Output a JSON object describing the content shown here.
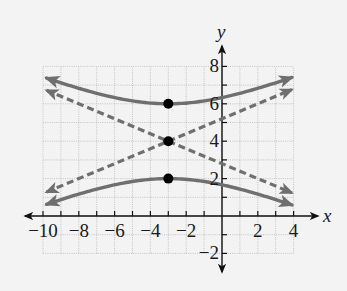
{
  "chart_data": {
    "type": "line",
    "title": "",
    "xlabel": "x",
    "ylabel": "y",
    "xlim": [
      -10,
      4
    ],
    "ylim": [
      -2,
      8
    ],
    "grid": true,
    "x_tick_labels": [
      "-10",
      "-8",
      "-6",
      "-4",
      "-2",
      "2",
      "4"
    ],
    "x_tick_values": [
      -10,
      -8,
      -6,
      -4,
      -2,
      2,
      4
    ],
    "y_tick_labels": [
      "-2",
      "2",
      "4",
      "6",
      "8"
    ],
    "y_tick_values": [
      -2,
      2,
      4,
      6,
      8
    ],
    "hyperbola": {
      "center": [
        -3,
        4
      ],
      "a": 2,
      "b": 5,
      "orientation": "vertical",
      "x_range": [
        -9.8,
        3.9
      ]
    },
    "series": [
      {
        "name": "upper branch",
        "style": "solid",
        "x": [
          -9.8,
          -8,
          -6,
          -4,
          -3,
          -2,
          0,
          2,
          3.9
        ],
        "y": [
          7.37,
          6.69,
          6.33,
          6.02,
          6.0,
          6.02,
          6.33,
          6.69,
          7.37
        ]
      },
      {
        "name": "lower branch",
        "style": "solid",
        "x": [
          -9.8,
          -8,
          -6,
          -4,
          -3,
          -2,
          0,
          2,
          3.9
        ],
        "y": [
          0.63,
          1.31,
          1.67,
          1.98,
          2.0,
          1.98,
          1.67,
          1.31,
          0.63
        ]
      },
      {
        "name": "asymptote rising",
        "style": "dashed",
        "x": [
          -9.8,
          3.9
        ],
        "y": [
          1.28,
          6.76
        ]
      },
      {
        "name": "asymptote falling",
        "style": "dashed",
        "x": [
          -9.8,
          3.9
        ],
        "y": [
          6.72,
          1.24
        ]
      }
    ],
    "points": [
      {
        "label": "vertex upper",
        "x": -3,
        "y": 6
      },
      {
        "label": "center",
        "x": -3,
        "y": 4
      },
      {
        "label": "vertex lower",
        "x": -3,
        "y": 2
      }
    ],
    "colors": {
      "curve": "#6f6f6f",
      "axis": "#111111",
      "grid": "#b8b8b8",
      "point": "#000000",
      "background": "#f3f3f3"
    }
  }
}
